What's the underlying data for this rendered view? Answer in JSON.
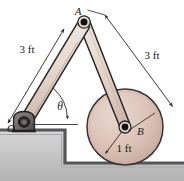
{
  "figure": {
    "type": "engineering-mechanism-diagram",
    "width": 184,
    "height": 181,
    "background_color": "#ffffff",
    "labels": {
      "point_a": "A",
      "point_o": "O",
      "point_b": "B",
      "angle_theta": "θ",
      "dim_left": "3 ft",
      "dim_right": "3 ft",
      "dim_radius": "1 ft"
    },
    "colors": {
      "link_fill": "#e2d2c8",
      "link_fill_light": "#efe6e0",
      "link_stroke": "#2b2724",
      "disk_fill": "#d9c0b5",
      "disk_fill_light": "#e8d6cd",
      "disk_stroke": "#3a3330",
      "support_fill": "#6e6a68",
      "support_stroke": "#2b2724",
      "pin_fill": "#14120f",
      "ground_fill": "#c9c9c9",
      "ground_fill_dark": "#9a9a9a",
      "ground_edge": "#55555a",
      "dimension_line": "#2b2724",
      "text_color": "#1a1a1a"
    },
    "geometry": {
      "point_a": [
        84,
        22
      ],
      "point_o": [
        24,
        122
      ],
      "point_b": [
        125,
        127
      ],
      "disk_radius": 38,
      "link_oa_length_ft": 3,
      "link_ab_length_ft": 3,
      "disk_radius_ft": 1,
      "ground_upper_y": 130,
      "ground_lower_y": 163,
      "step_x": 65
    },
    "label_positions": {
      "point_a": [
        78,
        15
      ],
      "point_o": [
        11,
        132
      ],
      "point_b": [
        136,
        134
      ],
      "angle_theta": [
        58,
        110
      ],
      "dim_left": [
        26,
        50
      ],
      "dim_right": [
        150,
        56
      ],
      "dim_radius": [
        122,
        151
      ]
    }
  }
}
